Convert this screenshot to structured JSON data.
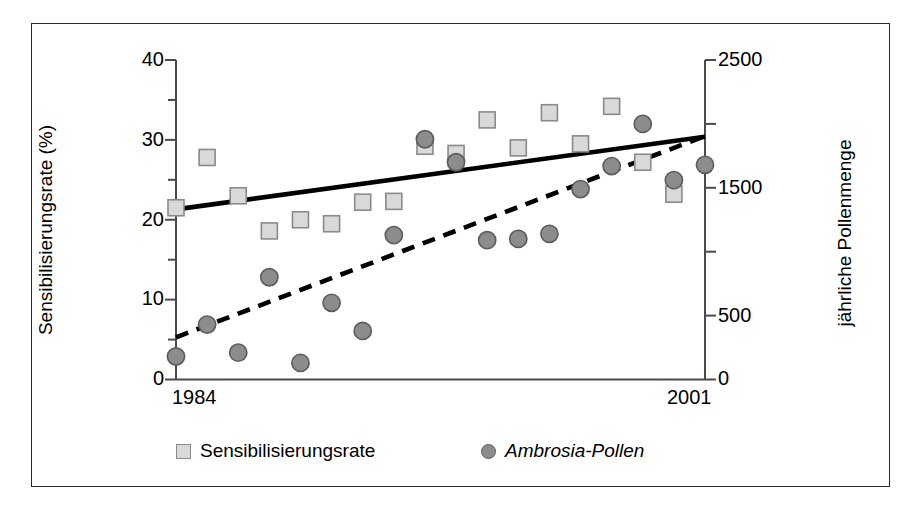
{
  "figure": {
    "background": "#ffffff",
    "border_color": "#2b2b2b"
  },
  "axes": {
    "left": {
      "title": "Sensibilisierungsrate (%)",
      "ticks_major": [
        "0",
        "10",
        "20",
        "30",
        "40"
      ],
      "tick_values_major": [
        0,
        10,
        20,
        30,
        40
      ],
      "tick_values_minor": [
        5,
        15,
        25,
        35
      ],
      "min": 0,
      "max": 40
    },
    "right": {
      "title": "jährliche Pollenmenge",
      "ticks_major": [
        "0",
        "500",
        "1500",
        "2500"
      ],
      "tick_values_major": [
        0,
        500,
        1500,
        2500
      ],
      "tick_values_all": [
        0,
        500,
        1000,
        1500,
        2000,
        2500
      ],
      "min": 0,
      "max": 2500
    },
    "bottom": {
      "title": "",
      "ticks": [
        "1984",
        "2001"
      ],
      "min": 1984,
      "max": 2001
    }
  },
  "legend": {
    "items": [
      {
        "label": "Sensibilisierungsrate",
        "marker": "square",
        "color": "#d9d9d9",
        "edge": "#8a8a8a",
        "italic": false
      },
      {
        "label": "Ambrosia-Pollen",
        "marker": "circle",
        "color": "#8c8c8c",
        "edge": "#5c5c5c",
        "italic": true
      }
    ]
  },
  "chart_data": {
    "type": "scatter",
    "title": "",
    "xlabel": "",
    "ylabel": "Sensibilisierungsrate (%)",
    "y2label": "jährliche Pollenmenge",
    "xlim": [
      1984,
      2001
    ],
    "ylim": [
      0,
      40
    ],
    "y2lim": [
      0,
      2500
    ],
    "grid": false,
    "legend_position": "bottom",
    "x": [
      1984,
      1985,
      1986,
      1987,
      1988,
      1989,
      1990,
      1991,
      1992,
      1993,
      1994,
      1995,
      1996,
      1997,
      1998,
      1999,
      2000,
      2001
    ],
    "series": [
      {
        "name": "Sensibilisierungsrate",
        "axis": "left",
        "marker": "square",
        "color": "#d9d9d9",
        "edge": "#8a8a8a",
        "x": [
          1984,
          1985,
          1986,
          1987,
          1988,
          1989,
          1990,
          1991,
          1992,
          1993,
          1994,
          1995,
          1996,
          1997,
          1998,
          1999,
          2000
        ],
        "values": [
          21.5,
          27.8,
          23.0,
          18.6,
          20.0,
          19.5,
          22.2,
          22.3,
          29.2,
          28.3,
          32.5,
          29.0,
          33.4,
          29.5,
          34.2,
          27.2,
          23.2
        ]
      },
      {
        "name": "Ambrosia-Pollen",
        "axis": "right",
        "marker": "circle",
        "color": "#8c8c8c",
        "edge": "#5c5c5c",
        "x": [
          1984,
          1985,
          1986,
          1987,
          1988,
          1989,
          1990,
          1991,
          1992,
          1993,
          1994,
          1995,
          1996,
          1997,
          1998,
          1999,
          2000,
          2001
        ],
        "values": [
          180,
          430,
          210,
          800,
          130,
          600,
          380,
          1130,
          1880,
          1700,
          1090,
          1100,
          1140,
          1490,
          1670,
          2000,
          1560,
          1680
        ]
      }
    ],
    "trendlines": [
      {
        "name": "Sensibilisierungsrate-trend",
        "style": "solid",
        "axis": "left",
        "color": "#000000",
        "x0": 1984,
        "y0": 21.3,
        "x1": 2001,
        "y1": 30.4
      },
      {
        "name": "Ambrosia-Pollen-trend",
        "style": "dashed",
        "axis": "right",
        "color": "#000000",
        "x0": 1984,
        "y0": 330,
        "x1": 2001,
        "y1": 1905
      }
    ]
  }
}
